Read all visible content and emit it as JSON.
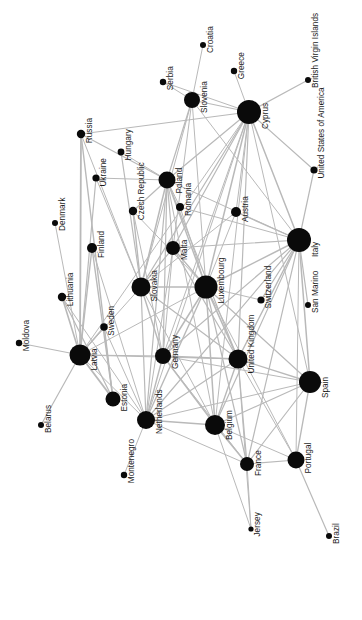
{
  "figure": {
    "type": "network-graph",
    "title": "",
    "background_color": "#ffffff",
    "node_color": "#0a0a0a",
    "edge_color": "#b9b9b9",
    "label_color": "#1a1a1a",
    "label_rotation_degrees": -90,
    "width": 362,
    "height": 620
  },
  "chart_data": {
    "type": "scatter",
    "title": "",
    "xlabel": "",
    "ylabel": "",
    "nodes": [
      {
        "id": "Croatia",
        "label": "Croatia",
        "x": 203,
        "y": 45,
        "size": 3.0
      },
      {
        "id": "Greece",
        "label": "Greece",
        "x": 234,
        "y": 71,
        "size": 3.2
      },
      {
        "id": "British Virgin Islands",
        "label": "British Virgin Islands",
        "x": 308,
        "y": 80,
        "size": 3.0
      },
      {
        "id": "Serbia",
        "label": "Serbia",
        "x": 163,
        "y": 82,
        "size": 3.2
      },
      {
        "id": "Slovenia",
        "label": "Slovenia",
        "x": 192,
        "y": 100,
        "size": 8.0
      },
      {
        "id": "Cyprus",
        "label": "Cyprus",
        "x": 249,
        "y": 112,
        "size": 12.0
      },
      {
        "id": "Russia",
        "label": "Russia",
        "x": 81,
        "y": 134,
        "size": 4.2
      },
      {
        "id": "Hungary",
        "label": "Hungary",
        "x": 121,
        "y": 152,
        "size": 3.4
      },
      {
        "id": "United States of America",
        "label": "United States of America",
        "x": 314,
        "y": 170,
        "size": 3.6
      },
      {
        "id": "Ukraine",
        "label": "Ukraine",
        "x": 96,
        "y": 178,
        "size": 3.6
      },
      {
        "id": "Poland",
        "label": "Poland",
        "x": 167,
        "y": 180,
        "size": 8.5
      },
      {
        "id": "Romania",
        "label": "Romania",
        "x": 180,
        "y": 207,
        "size": 4.0
      },
      {
        "id": "Czech Republic",
        "label": "Czech Republic",
        "x": 133,
        "y": 211,
        "size": 4.2
      },
      {
        "id": "Austria",
        "label": "Austria",
        "x": 236,
        "y": 212,
        "size": 5.0
      },
      {
        "id": "Denmark",
        "label": "Denmark",
        "x": 55,
        "y": 223,
        "size": 3.0
      },
      {
        "id": "Italy",
        "label": "Italy",
        "x": 299,
        "y": 240,
        "size": 12.0
      },
      {
        "id": "Malta",
        "label": "Malta",
        "x": 173,
        "y": 248,
        "size": 7.0
      },
      {
        "id": "Finland",
        "label": "Finland",
        "x": 92,
        "y": 248,
        "size": 5.0
      },
      {
        "id": "Slovakia",
        "label": "Slovakia",
        "x": 141,
        "y": 287,
        "size": 9.5
      },
      {
        "id": "Luxembourg",
        "label": "Luxembourg",
        "x": 206,
        "y": 287,
        "size": 11.5
      },
      {
        "id": "Lithuania",
        "label": "Lithuania",
        "x": 62,
        "y": 297,
        "size": 4.2
      },
      {
        "id": "Switzerland",
        "label": "Switzerland",
        "x": 261,
        "y": 300,
        "size": 3.6
      },
      {
        "id": "San Marino",
        "label": "San Marino",
        "x": 308,
        "y": 305,
        "size": 3.0
      },
      {
        "id": "Sweden",
        "label": "Sweden",
        "x": 104,
        "y": 327,
        "size": 3.8
      },
      {
        "id": "Moldova",
        "label": "Moldova",
        "x": 19,
        "y": 343,
        "size": 3.2
      },
      {
        "id": "Latvia",
        "label": "Latvia",
        "x": 80,
        "y": 355,
        "size": 10.5
      },
      {
        "id": "Germany",
        "label": "Germany",
        "x": 163,
        "y": 356,
        "size": 8.0
      },
      {
        "id": "United Kingdom",
        "label": "United Kingdom",
        "x": 238,
        "y": 359,
        "size": 9.5
      },
      {
        "id": "Spain",
        "label": "Spain",
        "x": 310,
        "y": 382,
        "size": 11.0
      },
      {
        "id": "Estonia",
        "label": "Estonia",
        "x": 113,
        "y": 399,
        "size": 7.5
      },
      {
        "id": "Netherlands",
        "label": "Netherlands",
        "x": 146,
        "y": 420,
        "size": 9.0
      },
      {
        "id": "Belgium",
        "label": "Belgium",
        "x": 215,
        "y": 425,
        "size": 10.0
      },
      {
        "id": "Belarus",
        "label": "Belarus",
        "x": 41,
        "y": 425,
        "size": 3.0
      },
      {
        "id": "Portugal",
        "label": "Portugal",
        "x": 296,
        "y": 460,
        "size": 8.5
      },
      {
        "id": "France",
        "label": "France",
        "x": 247,
        "y": 464,
        "size": 7.0
      },
      {
        "id": "Montenegro",
        "label": "Montenegro",
        "x": 124,
        "y": 475,
        "size": 3.2
      },
      {
        "id": "Jersey",
        "label": "Jersey",
        "x": 251,
        "y": 529,
        "size": 2.6
      },
      {
        "id": "Brazil",
        "label": "Brazil",
        "x": 329,
        "y": 536,
        "size": 3.0
      }
    ],
    "edges": [
      {
        "source": "Croatia",
        "target": "Slovenia",
        "weight": 1.0
      },
      {
        "source": "Serbia",
        "target": "Slovenia",
        "weight": 1.0
      },
      {
        "source": "Serbia",
        "target": "Cyprus",
        "weight": 1.0
      },
      {
        "source": "Greece",
        "target": "Cyprus",
        "weight": 1.0
      },
      {
        "source": "Slovenia",
        "target": "Cyprus",
        "weight": 1.2
      },
      {
        "source": "Slovenia",
        "target": "Poland",
        "weight": 1.2
      },
      {
        "source": "Slovenia",
        "target": "Luxembourg",
        "weight": 1.0
      },
      {
        "source": "Slovenia",
        "target": "Slovakia",
        "weight": 1.0
      },
      {
        "source": "Slovenia",
        "target": "Malta",
        "weight": 1.0
      },
      {
        "source": "Slovenia",
        "target": "Italy",
        "weight": 1.0
      },
      {
        "source": "Cyprus",
        "target": "British Virgin Islands",
        "weight": 1.2
      },
      {
        "source": "Cyprus",
        "target": "United States of America",
        "weight": 1.2
      },
      {
        "source": "Cyprus",
        "target": "Russia",
        "weight": 1.2
      },
      {
        "source": "Cyprus",
        "target": "Poland",
        "weight": 1.2
      },
      {
        "source": "Cyprus",
        "target": "Italy",
        "weight": 1.5
      },
      {
        "source": "Cyprus",
        "target": "Luxembourg",
        "weight": 1.5
      },
      {
        "source": "Cyprus",
        "target": "Malta",
        "weight": 1.2
      },
      {
        "source": "Cyprus",
        "target": "Slovakia",
        "weight": 1.2
      },
      {
        "source": "Cyprus",
        "target": "Germany",
        "weight": 1.0
      },
      {
        "source": "Cyprus",
        "target": "United Kingdom",
        "weight": 1.2
      },
      {
        "source": "Cyprus",
        "target": "Belgium",
        "weight": 1.0
      },
      {
        "source": "Cyprus",
        "target": "Netherlands",
        "weight": 1.0
      },
      {
        "source": "Cyprus",
        "target": "Spain",
        "weight": 1.0
      },
      {
        "source": "Cyprus",
        "target": "Latvia",
        "weight": 1.0
      },
      {
        "source": "Cyprus",
        "target": "Austria",
        "weight": 1.0
      },
      {
        "source": "Russia",
        "target": "Poland",
        "weight": 1.2
      },
      {
        "source": "Russia",
        "target": "Latvia",
        "weight": 1.8
      },
      {
        "source": "Russia",
        "target": "Estonia",
        "weight": 1.4
      },
      {
        "source": "Russia",
        "target": "Slovakia",
        "weight": 1.0
      },
      {
        "source": "Hungary",
        "target": "Poland",
        "weight": 1.0
      },
      {
        "source": "Hungary",
        "target": "Slovakia",
        "weight": 1.2
      },
      {
        "source": "Ukraine",
        "target": "Poland",
        "weight": 1.0
      },
      {
        "source": "Ukraine",
        "target": "Latvia",
        "weight": 1.2
      },
      {
        "source": "Ukraine",
        "target": "Slovakia",
        "weight": 1.0
      },
      {
        "source": "Poland",
        "target": "Romania",
        "weight": 1.0
      },
      {
        "source": "Poland",
        "target": "Czech Republic",
        "weight": 1.2
      },
      {
        "source": "Poland",
        "target": "Malta",
        "weight": 1.2
      },
      {
        "source": "Poland",
        "target": "Slovakia",
        "weight": 1.5
      },
      {
        "source": "Poland",
        "target": "Luxembourg",
        "weight": 1.4
      },
      {
        "source": "Poland",
        "target": "Germany",
        "weight": 1.2
      },
      {
        "source": "Poland",
        "target": "Netherlands",
        "weight": 1.2
      },
      {
        "source": "Poland",
        "target": "United Kingdom",
        "weight": 1.2
      },
      {
        "source": "Poland",
        "target": "Italy",
        "weight": 1.0
      },
      {
        "source": "Poland",
        "target": "Belgium",
        "weight": 1.0
      },
      {
        "source": "Czech Republic",
        "target": "Slovakia",
        "weight": 1.4
      },
      {
        "source": "Czech Republic",
        "target": "Luxembourg",
        "weight": 1.0
      },
      {
        "source": "Czech Republic",
        "target": "Germany",
        "weight": 1.0
      },
      {
        "source": "Romania",
        "target": "Italy",
        "weight": 1.0
      },
      {
        "source": "Romania",
        "target": "Luxembourg",
        "weight": 1.0
      },
      {
        "source": "Austria",
        "target": "Italy",
        "weight": 1.2
      },
      {
        "source": "Austria",
        "target": "Luxembourg",
        "weight": 1.0
      },
      {
        "source": "Austria",
        "target": "Slovakia",
        "weight": 1.0
      },
      {
        "source": "Denmark",
        "target": "Latvia",
        "weight": 1.0
      },
      {
        "source": "Finland",
        "target": "Latvia",
        "weight": 1.4
      },
      {
        "source": "Finland",
        "target": "Estonia",
        "weight": 1.4
      },
      {
        "source": "Finland",
        "target": "Netherlands",
        "weight": 1.0
      },
      {
        "source": "Malta",
        "target": "Luxembourg",
        "weight": 1.4
      },
      {
        "source": "Malta",
        "target": "Slovakia",
        "weight": 1.2
      },
      {
        "source": "Malta",
        "target": "Italy",
        "weight": 1.2
      },
      {
        "source": "Malta",
        "target": "United Kingdom",
        "weight": 1.2
      },
      {
        "source": "Malta",
        "target": "Germany",
        "weight": 1.0
      },
      {
        "source": "Malta",
        "target": "Netherlands",
        "weight": 1.0
      },
      {
        "source": "Italy",
        "target": "San Marino",
        "weight": 1.2
      },
      {
        "source": "Italy",
        "target": "United States of America",
        "weight": 1.2
      },
      {
        "source": "Italy",
        "target": "Switzerland",
        "weight": 1.2
      },
      {
        "source": "Italy",
        "target": "Luxembourg",
        "weight": 1.5
      },
      {
        "source": "Italy",
        "target": "United Kingdom",
        "weight": 1.4
      },
      {
        "source": "Italy",
        "target": "Spain",
        "weight": 1.5
      },
      {
        "source": "Italy",
        "target": "Germany",
        "weight": 1.2
      },
      {
        "source": "Italy",
        "target": "Belgium",
        "weight": 1.2
      },
      {
        "source": "Italy",
        "target": "Netherlands",
        "weight": 1.2
      },
      {
        "source": "Italy",
        "target": "France",
        "weight": 1.2
      },
      {
        "source": "Italy",
        "target": "Portugal",
        "weight": 1.0
      },
      {
        "source": "Slovakia",
        "target": "Luxembourg",
        "weight": 1.4
      },
      {
        "source": "Slovakia",
        "target": "Germany",
        "weight": 1.4
      },
      {
        "source": "Slovakia",
        "target": "Netherlands",
        "weight": 1.2
      },
      {
        "source": "Slovakia",
        "target": "United Kingdom",
        "weight": 1.2
      },
      {
        "source": "Slovakia",
        "target": "Belgium",
        "weight": 1.0
      },
      {
        "source": "Slovakia",
        "target": "Latvia",
        "weight": 1.0
      },
      {
        "source": "Luxembourg",
        "target": "Switzerland",
        "weight": 1.0
      },
      {
        "source": "Luxembourg",
        "target": "United Kingdom",
        "weight": 1.6
      },
      {
        "source": "Luxembourg",
        "target": "Germany",
        "weight": 1.5
      },
      {
        "source": "Luxembourg",
        "target": "Netherlands",
        "weight": 1.4
      },
      {
        "source": "Luxembourg",
        "target": "Belgium",
        "weight": 1.5
      },
      {
        "source": "Luxembourg",
        "target": "Spain",
        "weight": 1.2
      },
      {
        "source": "Luxembourg",
        "target": "France",
        "weight": 1.2
      },
      {
        "source": "Luxembourg",
        "target": "Portugal",
        "weight": 1.0
      },
      {
        "source": "Luxembourg",
        "target": "Latvia",
        "weight": 1.0
      },
      {
        "source": "Lithuania",
        "target": "Latvia",
        "weight": 1.6
      },
      {
        "source": "Lithuania",
        "target": "Estonia",
        "weight": 1.2
      },
      {
        "source": "Lithuania",
        "target": "Netherlands",
        "weight": 1.0
      },
      {
        "source": "Sweden",
        "target": "Latvia",
        "weight": 1.2
      },
      {
        "source": "Sweden",
        "target": "Estonia",
        "weight": 1.0
      },
      {
        "source": "Sweden",
        "target": "Netherlands",
        "weight": 1.0
      },
      {
        "source": "Moldova",
        "target": "Latvia",
        "weight": 1.2
      },
      {
        "source": "Latvia",
        "target": "Estonia",
        "weight": 1.8
      },
      {
        "source": "Latvia",
        "target": "Belarus",
        "weight": 1.2
      },
      {
        "source": "Latvia",
        "target": "Germany",
        "weight": 1.0
      },
      {
        "source": "Latvia",
        "target": "Netherlands",
        "weight": 1.0
      },
      {
        "source": "Latvia",
        "target": "United Kingdom",
        "weight": 1.0
      },
      {
        "source": "Germany",
        "target": "United Kingdom",
        "weight": 1.4
      },
      {
        "source": "Germany",
        "target": "Netherlands",
        "weight": 1.4
      },
      {
        "source": "Germany",
        "target": "Belgium",
        "weight": 1.4
      },
      {
        "source": "Germany",
        "target": "Spain",
        "weight": 1.0
      },
      {
        "source": "Germany",
        "target": "France",
        "weight": 1.0
      },
      {
        "source": "United Kingdom",
        "target": "Spain",
        "weight": 1.4
      },
      {
        "source": "United Kingdom",
        "target": "Belgium",
        "weight": 1.4
      },
      {
        "source": "United Kingdom",
        "target": "Netherlands",
        "weight": 1.2
      },
      {
        "source": "United Kingdom",
        "target": "France",
        "weight": 1.2
      },
      {
        "source": "United Kingdom",
        "target": "Portugal",
        "weight": 1.0
      },
      {
        "source": "United Kingdom",
        "target": "Jersey",
        "weight": 1.0
      },
      {
        "source": "Spain",
        "target": "Portugal",
        "weight": 1.4
      },
      {
        "source": "Spain",
        "target": "France",
        "weight": 1.2
      },
      {
        "source": "Spain",
        "target": "Belgium",
        "weight": 1.2
      },
      {
        "source": "Spain",
        "target": "Netherlands",
        "weight": 1.0
      },
      {
        "source": "Netherlands",
        "target": "Belgium",
        "weight": 1.4
      },
      {
        "source": "Netherlands",
        "target": "Montenegro",
        "weight": 1.0
      },
      {
        "source": "Netherlands",
        "target": "France",
        "weight": 1.0
      },
      {
        "source": "Belgium",
        "target": "France",
        "weight": 1.4
      },
      {
        "source": "Belgium",
        "target": "Portugal",
        "weight": 1.0
      },
      {
        "source": "Belgium",
        "target": "Jersey",
        "weight": 1.0
      },
      {
        "source": "France",
        "target": "Portugal",
        "weight": 1.2
      },
      {
        "source": "France",
        "target": "Jersey",
        "weight": 1.0
      },
      {
        "source": "Portugal",
        "target": "Brazil",
        "weight": 1.2
      }
    ]
  }
}
